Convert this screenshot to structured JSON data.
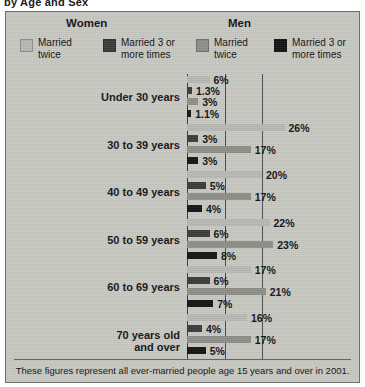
{
  "cut_title": "by Age and Sex",
  "header": {
    "women": "Women",
    "men": "Men"
  },
  "legend": [
    {
      "label": "Married\ntwice",
      "color": "#b9b9b4",
      "name": "women-married-twice"
    },
    {
      "label": "Married 3 or\nmore times",
      "color": "#3a3a3a",
      "name": "women-married-3-or-more"
    },
    {
      "label": "Married\ntwice",
      "color": "#8e8e89",
      "name": "men-married-twice"
    },
    {
      "label": "Married 3 or\nmore times",
      "color": "#121212",
      "name": "men-married-3-or-more"
    }
  ],
  "footnote": "These figures represent all ever-married people age 15 years and over in 2001.",
  "chart_data": {
    "type": "bar",
    "orientation": "horizontal",
    "title": "by Age and Sex",
    "xlabel": "",
    "ylabel": "",
    "xlim": [
      0,
      30
    ],
    "gridlines": [
      10,
      20
    ],
    "grid": true,
    "legend_position": "top",
    "categories": [
      "Under 30 years",
      "30 to 39 years",
      "40 to 49 years",
      "50 to 59 years",
      "60 to 69 years",
      "70 years old\nand over"
    ],
    "series": [
      {
        "name": "Women: Married twice",
        "color": "#b9b9b4",
        "values": [
          6,
          26,
          20,
          22,
          17,
          16
        ],
        "labels": [
          "6%",
          "26%",
          "20%",
          "22%",
          "17%",
          "16%"
        ]
      },
      {
        "name": "Women: Married 3 or more times",
        "color": "#3a3a3a",
        "values": [
          1.3,
          3,
          5,
          6,
          6,
          4
        ],
        "labels": [
          "1.3%",
          "3%",
          "5%",
          "6%",
          "6%",
          "4%"
        ]
      },
      {
        "name": "Men: Married twice",
        "color": "#8e8e89",
        "values": [
          3,
          17,
          17,
          23,
          21,
          17
        ],
        "labels": [
          "3%",
          "17%",
          "17%",
          "23%",
          "21%",
          "17%"
        ]
      },
      {
        "name": "Men: Married 3 or more times",
        "color": "#121212",
        "values": [
          1.1,
          3,
          4,
          8,
          7,
          5
        ],
        "labels": [
          "1.1%",
          "3%",
          "4%",
          "8%",
          "7%",
          "5%"
        ]
      }
    ]
  }
}
